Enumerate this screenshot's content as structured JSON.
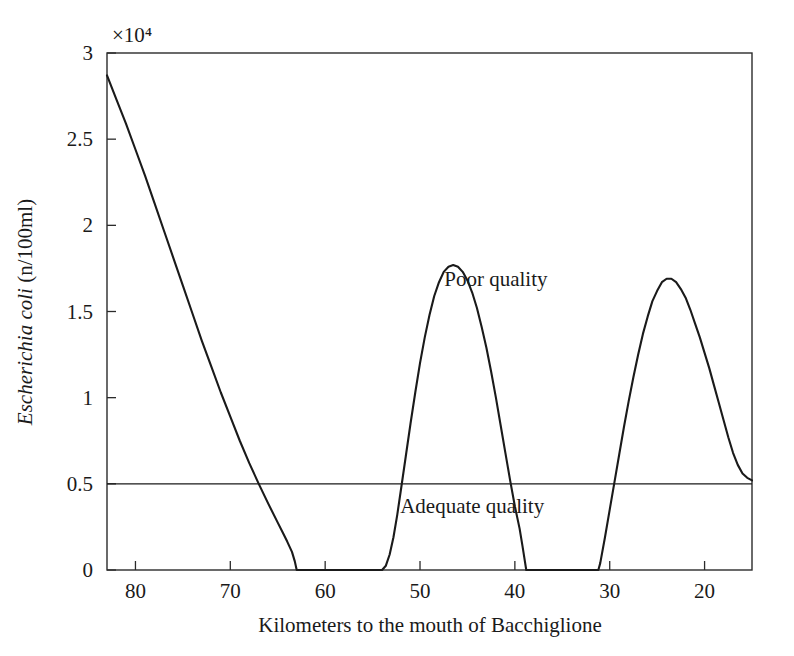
{
  "chart_data": {
    "type": "line",
    "title": "",
    "xlabel": "Kilometers to the mouth of Bacchiglione",
    "ylabel": "Escherichia coli (n/100ml)",
    "ylabel_italic_part": "Escherichia coli",
    "ylabel_roman_part": " (n/100ml)",
    "y_exponent_label": "×10⁴",
    "y_exponent_value": 10000,
    "xlim": [
      83,
      15
    ],
    "ylim": [
      0,
      30000
    ],
    "x_reversed": true,
    "grid": false,
    "legend": null,
    "x_ticks": [
      80,
      70,
      60,
      50,
      40,
      30,
      20
    ],
    "x_tick_labels": [
      "80",
      "70",
      "60",
      "50",
      "40",
      "30",
      "20"
    ],
    "y_ticks": [
      0,
      5000,
      10000,
      15000,
      20000,
      25000,
      30000
    ],
    "y_tick_labels": [
      "0",
      "0.5",
      "1",
      "1.5",
      "2",
      "2.5",
      "3"
    ],
    "series": [
      {
        "name": "Escherichia coli concentration",
        "color": "#1a1a1a",
        "points": [
          [
            83.0,
            28700
          ],
          [
            82.0,
            27300
          ],
          [
            81.0,
            25900
          ],
          [
            80.0,
            24400
          ],
          [
            79.0,
            22900
          ],
          [
            78.0,
            21300
          ],
          [
            77.0,
            19700
          ],
          [
            76.0,
            18100
          ],
          [
            75.0,
            16500
          ],
          [
            74.0,
            14900
          ],
          [
            73.0,
            13300
          ],
          [
            72.0,
            11800
          ],
          [
            71.0,
            10300
          ],
          [
            70.0,
            8900
          ],
          [
            69.0,
            7500
          ],
          [
            68.0,
            6200
          ],
          [
            67.0,
            5000
          ],
          [
            66.0,
            3850
          ],
          [
            65.0,
            2750
          ],
          [
            64.5,
            2200
          ],
          [
            64.0,
            1650
          ],
          [
            63.5,
            1050
          ],
          [
            63.2,
            500
          ],
          [
            63.0,
            0
          ],
          [
            62.0,
            0
          ],
          [
            60.0,
            0
          ],
          [
            58.0,
            0
          ],
          [
            56.0,
            0
          ],
          [
            54.5,
            0
          ],
          [
            54.0,
            0
          ],
          [
            53.6,
            250
          ],
          [
            53.2,
            900
          ],
          [
            52.8,
            1900
          ],
          [
            52.4,
            3200
          ],
          [
            52.0,
            4700
          ],
          [
            51.5,
            6600
          ],
          [
            51.0,
            8500
          ],
          [
            50.5,
            10300
          ],
          [
            50.0,
            12000
          ],
          [
            49.5,
            13500
          ],
          [
            49.0,
            14800
          ],
          [
            48.5,
            15900
          ],
          [
            48.0,
            16700
          ],
          [
            47.5,
            17300
          ],
          [
            47.0,
            17600
          ],
          [
            46.5,
            17700
          ],
          [
            46.0,
            17600
          ],
          [
            45.5,
            17300
          ],
          [
            45.0,
            16800
          ],
          [
            44.5,
            16100
          ],
          [
            44.0,
            15200
          ],
          [
            43.5,
            14100
          ],
          [
            43.0,
            12900
          ],
          [
            42.5,
            11500
          ],
          [
            42.0,
            10000
          ],
          [
            41.5,
            8400
          ],
          [
            41.0,
            6800
          ],
          [
            40.5,
            5200
          ],
          [
            40.0,
            3700
          ],
          [
            39.5,
            2400
          ],
          [
            39.2,
            1400
          ],
          [
            39.0,
            700
          ],
          [
            38.8,
            0
          ],
          [
            38.0,
            0
          ],
          [
            36.0,
            0
          ],
          [
            34.0,
            0
          ],
          [
            32.0,
            0
          ],
          [
            31.5,
            0
          ],
          [
            31.2,
            0
          ],
          [
            31.0,
            400
          ],
          [
            30.5,
            1900
          ],
          [
            30.0,
            3500
          ],
          [
            29.5,
            5100
          ],
          [
            29.0,
            6700
          ],
          [
            28.5,
            8300
          ],
          [
            28.0,
            9800
          ],
          [
            27.5,
            11200
          ],
          [
            27.0,
            12500
          ],
          [
            26.5,
            13700
          ],
          [
            26.0,
            14700
          ],
          [
            25.5,
            15600
          ],
          [
            25.0,
            16200
          ],
          [
            24.5,
            16700
          ],
          [
            24.0,
            16900
          ],
          [
            23.5,
            16900
          ],
          [
            23.0,
            16700
          ],
          [
            22.5,
            16300
          ],
          [
            22.0,
            15800
          ],
          [
            21.5,
            15100
          ],
          [
            21.0,
            14300
          ],
          [
            20.5,
            13500
          ],
          [
            20.0,
            12600
          ],
          [
            19.5,
            11700
          ],
          [
            19.0,
            10700
          ],
          [
            18.5,
            9700
          ],
          [
            18.0,
            8700
          ],
          [
            17.5,
            7700
          ],
          [
            17.0,
            6800
          ],
          [
            16.5,
            6100
          ],
          [
            16.0,
            5600
          ],
          [
            15.5,
            5350
          ],
          [
            15.0,
            5200
          ]
        ]
      }
    ],
    "threshold": {
      "name": "quality-threshold",
      "value": 5000,
      "value_label": "0.5",
      "color": "#1a1a1a"
    },
    "annotations": [
      {
        "name": "poor-quality",
        "text": "Poor quality",
        "x": 42.0,
        "y": 16500
      },
      {
        "name": "adequate-quality",
        "text": "Adequate quality",
        "x": 44.5,
        "y": 3300
      }
    ]
  }
}
